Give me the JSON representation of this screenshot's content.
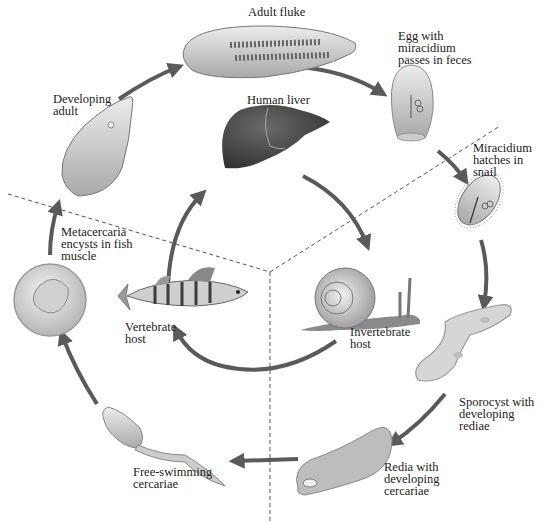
{
  "colors": {
    "arrow": "#5a5a5a",
    "dashed_line": "#555555",
    "liver": "#4a4a4a",
    "organism_fill": "#dcdcdc",
    "text": "#222222"
  },
  "stages": [
    {
      "id": "adult-fluke",
      "label": "Adult fluke"
    },
    {
      "id": "egg",
      "label": "Egg with\nmiracidium\npasses in feces"
    },
    {
      "id": "miracidium",
      "label": "Miracidium\nhatches in\nsnail"
    },
    {
      "id": "sporocyst",
      "label": "Sporocyst with\ndeveloping\nrediae"
    },
    {
      "id": "redia",
      "label": "Redia with\ndeveloping\ncercariae"
    },
    {
      "id": "cercariae",
      "label": "Free-swimming\ncercariae"
    },
    {
      "id": "metacercaria",
      "label": "Metacercaria\nencysts in fish\nmuscle"
    },
    {
      "id": "developing-adult",
      "label": "Developing\nadult"
    }
  ],
  "hosts": [
    {
      "id": "human-liver",
      "label": "Human liver"
    },
    {
      "id": "vertebrate-host",
      "label": "Vertebrate\nhost"
    },
    {
      "id": "invertebrate-host",
      "label": "Invertebrate\nhost"
    }
  ]
}
